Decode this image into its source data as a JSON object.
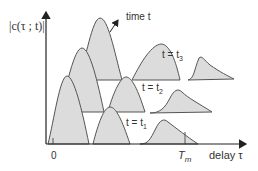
{
  "diagram": {
    "type": "delay profile snapshots over time",
    "y_axis_label": "|c(τ ; t)|",
    "x_axis_label": "delay τ",
    "x_origin_label": "0",
    "x_marker_label": "T",
    "x_marker_sub": "m",
    "time_arrow_label": "time t",
    "snapshots": [
      {
        "label_pre": "t = t",
        "label_sub": "1"
      },
      {
        "label_pre": "t = t",
        "label_sub": "2"
      },
      {
        "label_pre": "t = t",
        "label_sub": "3"
      }
    ],
    "colors": {
      "fill": "#dcdcdc",
      "stroke": "#555555",
      "axis": "#222222"
    }
  }
}
